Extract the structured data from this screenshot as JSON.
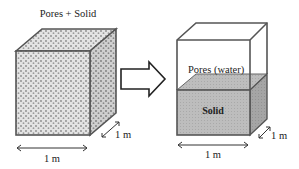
{
  "diagram": {
    "left_cube": {
      "label": "Pores + Solid",
      "width_label": "1 m",
      "depth_label": "1 m"
    },
    "arrow": {
      "direction": "right"
    },
    "right_box": {
      "top_label": "Pores (water)",
      "bottom_label": "Solid",
      "width_label": "1 m",
      "depth_label": "1 m"
    },
    "colors": {
      "outline": "#555555",
      "solid_fill": "#b8b8b8",
      "speckle_fill": "#d8d8d8",
      "text": "#222222"
    }
  }
}
